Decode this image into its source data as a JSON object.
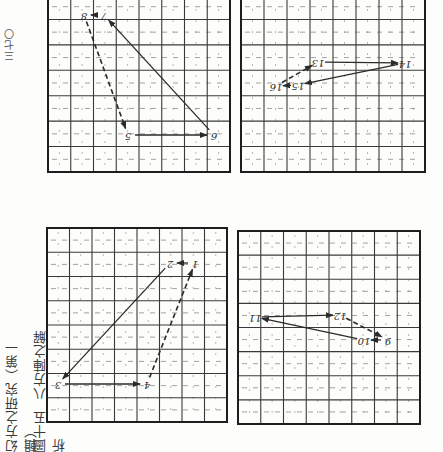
{
  "page": {
    "orientation": "rotated 180 degrees (scanned upside down)",
    "page_number": "三七〇",
    "running_header": "幻方之研究（第一輯）",
    "figure_label": "圖",
    "figure_number": "十五",
    "figure_caption": "八方陣之解析"
  },
  "colors": {
    "ink": "#2b2b2b",
    "grid_line": "#3a3a3a",
    "minor_dash": "#8a8a8a",
    "paper": "#fdfdfb"
  },
  "panels": [
    {
      "id": "panel-1-4",
      "grid": {
        "x": 47,
        "y": 228,
        "w": 180,
        "h": 194,
        "cols": 8,
        "rows": 8
      },
      "points": [
        {
          "label": "1",
          "x": 195,
          "y": 263
        },
        {
          "label": "2",
          "x": 170,
          "y": 263
        },
        {
          "label": "3",
          "x": 58,
          "y": 384
        },
        {
          "label": "4",
          "x": 147,
          "y": 384
        }
      ],
      "arrows": [
        {
          "from": "1",
          "to": "2",
          "style": "solid"
        },
        {
          "from": "2",
          "to": "3",
          "style": "solid"
        },
        {
          "from": "3",
          "to": "4",
          "style": "solid"
        },
        {
          "from": "4",
          "to": "1",
          "style": "dashed"
        }
      ]
    },
    {
      "id": "panel-5-8",
      "grid": {
        "x": 48,
        "y": -6,
        "w": 182,
        "h": 178,
        "cols": 8,
        "rows": 7
      },
      "points": [
        {
          "label": "5",
          "x": 128,
          "y": 135
        },
        {
          "label": "6",
          "x": 214,
          "y": 135
        },
        {
          "label": "7",
          "x": 104,
          "y": 15
        },
        {
          "label": "8",
          "x": 84,
          "y": 15
        }
      ],
      "arrows": [
        {
          "from": "5",
          "to": "6",
          "style": "solid"
        },
        {
          "from": "6",
          "to": "7",
          "style": "solid"
        },
        {
          "from": "7",
          "to": "8",
          "style": "solid"
        },
        {
          "from": "8",
          "to": "5",
          "style": "dashed"
        }
      ]
    },
    {
      "id": "panel-9-12",
      "grid": {
        "x": 238,
        "y": 231,
        "w": 182,
        "h": 193,
        "cols": 8,
        "rows": 8
      },
      "points": [
        {
          "label": "9",
          "x": 388,
          "y": 340
        },
        {
          "label": "10",
          "x": 364,
          "y": 340
        },
        {
          "label": "11",
          "x": 255,
          "y": 317
        },
        {
          "label": "12",
          "x": 340,
          "y": 315
        }
      ],
      "arrows": [
        {
          "from": "9",
          "to": "10",
          "style": "solid"
        },
        {
          "from": "10",
          "to": "11",
          "style": "solid"
        },
        {
          "from": "11",
          "to": "12",
          "style": "solid"
        },
        {
          "from": "12",
          "to": "9",
          "style": "dashed"
        }
      ]
    },
    {
      "id": "panel-13-16",
      "grid": {
        "x": 241,
        "y": -6,
        "w": 184,
        "h": 178,
        "cols": 8,
        "rows": 7
      },
      "points": [
        {
          "label": "13",
          "x": 318,
          "y": 62
        },
        {
          "label": "14",
          "x": 405,
          "y": 63
        },
        {
          "label": "15",
          "x": 298,
          "y": 85
        },
        {
          "label": "16",
          "x": 276,
          "y": 86
        }
      ],
      "arrows": [
        {
          "from": "13",
          "to": "14",
          "style": "solid"
        },
        {
          "from": "14",
          "to": "15",
          "style": "solid"
        },
        {
          "from": "15",
          "to": "16",
          "style": "solid"
        },
        {
          "from": "16",
          "to": "13",
          "style": "dashed"
        }
      ]
    }
  ]
}
